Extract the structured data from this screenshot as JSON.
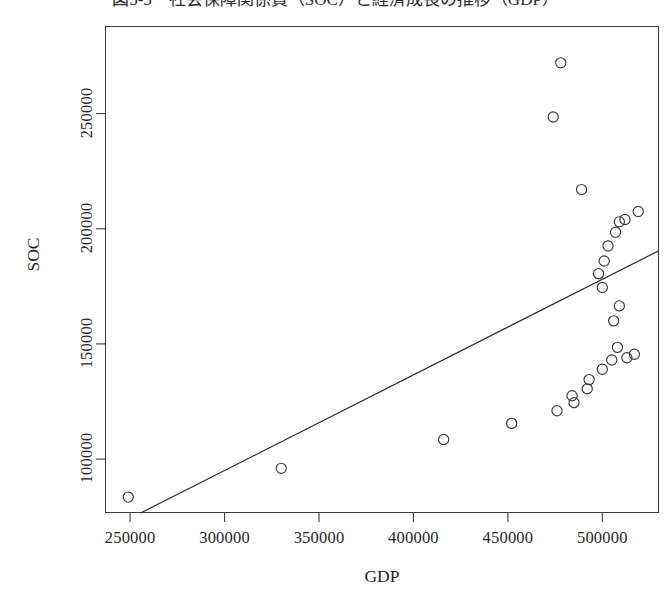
{
  "chart_data": {
    "type": "scatter",
    "title": "図5-5　社会保障関係費（SOC）と経済成長の推移（GDP）",
    "xlabel": "GDP",
    "ylabel": "SOC",
    "xlim": [
      236700,
      530000
    ],
    "ylim": [
      76600,
      288000
    ],
    "grid": false,
    "legend": null,
    "x_ticks": [
      250000,
      300000,
      350000,
      400000,
      450000,
      500000
    ],
    "x_tick_labels": [
      "250000",
      "300000",
      "350000",
      "400000",
      "450000",
      "500000"
    ],
    "y_ticks": [
      100000,
      150000,
      200000,
      250000
    ],
    "y_tick_labels": [
      "100000",
      "150000",
      "200000",
      "250000"
    ],
    "marker": "open-circle",
    "marker_color": "#3a3a3a",
    "series": [
      {
        "name": "SOC vs GDP",
        "points": [
          {
            "x": 249000,
            "y": 83500
          },
          {
            "x": 330000,
            "y": 96000
          },
          {
            "x": 416000,
            "y": 108500
          },
          {
            "x": 452000,
            "y": 115500
          },
          {
            "x": 476000,
            "y": 121000
          },
          {
            "x": 484000,
            "y": 127500
          },
          {
            "x": 485000,
            "y": 124500
          },
          {
            "x": 492000,
            "y": 130500
          },
          {
            "x": 493000,
            "y": 134500
          },
          {
            "x": 500000,
            "y": 139000
          },
          {
            "x": 505000,
            "y": 143000
          },
          {
            "x": 508000,
            "y": 148500
          },
          {
            "x": 513000,
            "y": 144000
          },
          {
            "x": 517000,
            "y": 145500
          },
          {
            "x": 506000,
            "y": 160000
          },
          {
            "x": 509000,
            "y": 166500
          },
          {
            "x": 500000,
            "y": 174500
          },
          {
            "x": 498000,
            "y": 180500
          },
          {
            "x": 501000,
            "y": 186000
          },
          {
            "x": 503000,
            "y": 192500
          },
          {
            "x": 507000,
            "y": 198500
          },
          {
            "x": 509000,
            "y": 203000
          },
          {
            "x": 512000,
            "y": 204000
          },
          {
            "x": 519000,
            "y": 207500
          },
          {
            "x": 489000,
            "y": 217000
          },
          {
            "x": 474000,
            "y": 248500
          },
          {
            "x": 478000,
            "y": 272000
          }
        ]
      }
    ],
    "trend_line": {
      "name": "regression-line",
      "color": "#2e2e2e",
      "start": {
        "x": 255500,
        "y": 76600
      },
      "end": {
        "x": 530000,
        "y": 190500
      }
    }
  }
}
